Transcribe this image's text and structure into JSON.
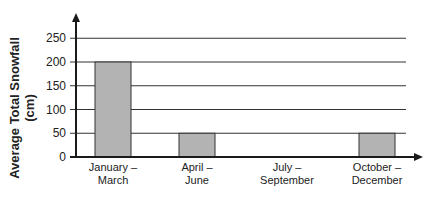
{
  "chart_data": {
    "type": "bar",
    "title": "",
    "xlabel": "",
    "ylabel": "Average Total Snowfall (cm)",
    "ylabel_lines": [
      "Average Total Snowfall",
      "(cm)"
    ],
    "categories": [
      "January – March",
      "April – June",
      "July – September",
      "October – December"
    ],
    "category_lines": [
      [
        "January –",
        "March"
      ],
      [
        "April –",
        "June"
      ],
      [
        "July –",
        "September"
      ],
      [
        "October –",
        "December"
      ]
    ],
    "values": [
      200,
      50,
      0,
      50
    ],
    "ylim": [
      0,
      250
    ],
    "yticks": [
      0,
      50,
      100,
      150,
      200,
      250
    ],
    "grid": true,
    "legend": null,
    "colors": {
      "bar_fill": "#b3b3b3",
      "bar_stroke": "#333333",
      "axis": "#1a1a1a",
      "grid": "#333333"
    }
  }
}
